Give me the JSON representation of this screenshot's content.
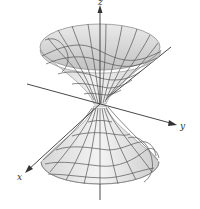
{
  "figure": {
    "type": "3d-surface",
    "axes": {
      "x": {
        "label": "x"
      },
      "y": {
        "label": "y"
      },
      "z": {
        "label": "z"
      }
    },
    "colors": {
      "surface_light": "#f2f2f2",
      "surface_mid": "#d9d9d9",
      "surface_dark": "#bdbdbd",
      "mesh": "#555555",
      "axis": "#333333",
      "background": "#ffffff"
    }
  }
}
